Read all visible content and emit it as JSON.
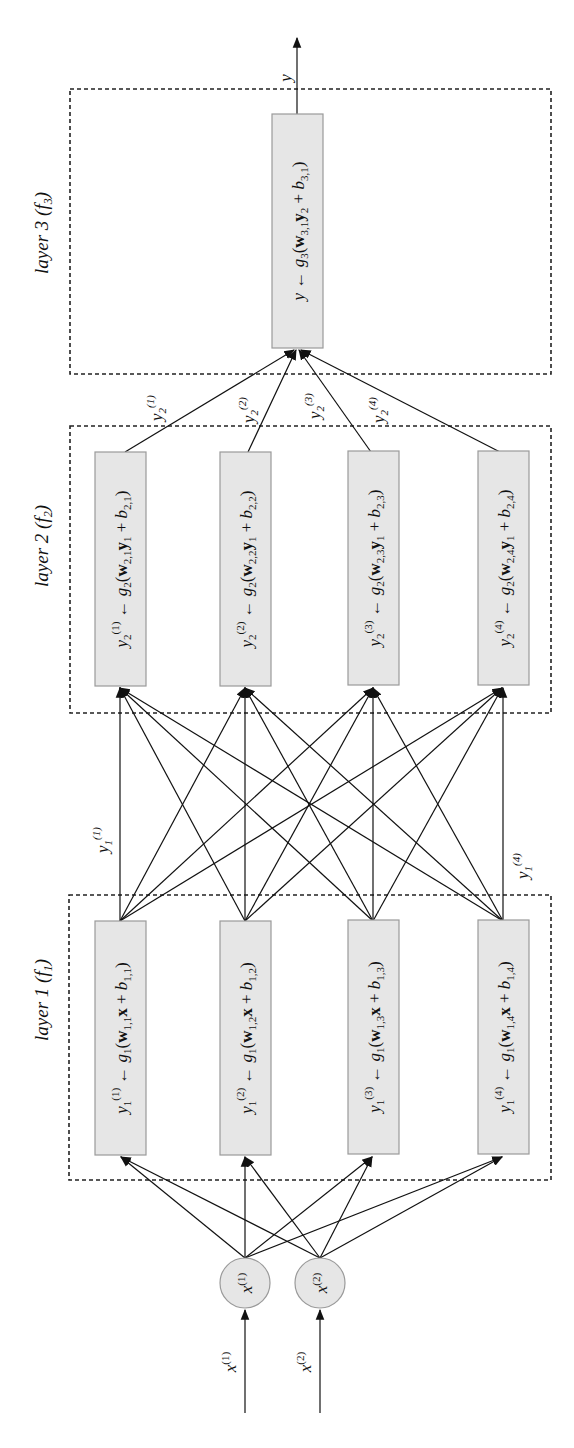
{
  "diagram": {
    "type": "feedforward-neural-network",
    "orientation": "rotated-90-ccw",
    "colors": {
      "node_fill": "#e6e6e6",
      "node_border": "#9a9a9a",
      "edge": "#111111",
      "layer_border": "#222222"
    },
    "inputs": [
      {
        "label": "x",
        "sup": "(1)",
        "node_label": "x",
        "node_sup": "(1)"
      },
      {
        "label": "x",
        "sup": "(2)",
        "node_label": "x",
        "node_sup": "(2)"
      }
    ],
    "layers": [
      {
        "label": "layer 1 (f",
        "label_sub": "1",
        "label_end": ")",
        "units": [
          {
            "lhs": "y",
            "lhs_sub": "1",
            "lhs_sup": "(1)",
            "arrow": "←",
            "g": "g",
            "g_sub": "1",
            "w": "w",
            "w_sub": "1,1",
            "input": "x",
            "plus": "+",
            "b": "b",
            "b_sub": "1,1"
          },
          {
            "lhs": "y",
            "lhs_sub": "1",
            "lhs_sup": "(2)",
            "arrow": "←",
            "g": "g",
            "g_sub": "1",
            "w": "w",
            "w_sub": "1,2",
            "input": "x",
            "plus": "+",
            "b": "b",
            "b_sub": "1,2"
          },
          {
            "lhs": "y",
            "lhs_sub": "1",
            "lhs_sup": "(3)",
            "arrow": "←",
            "g": "g",
            "g_sub": "1",
            "w": "w",
            "w_sub": "1,3",
            "input": "x",
            "plus": "+",
            "b": "b",
            "b_sub": "1,3"
          },
          {
            "lhs": "y",
            "lhs_sub": "1",
            "lhs_sup": "(4)",
            "arrow": "←",
            "g": "g",
            "g_sub": "1",
            "w": "w",
            "w_sub": "1,4",
            "input": "x",
            "plus": "+",
            "b": "b",
            "b_sub": "1,4"
          }
        ],
        "output_labels": [
          {
            "text": "y",
            "sub": "1",
            "sup": "(1)"
          },
          {
            "text": "y",
            "sub": "1",
            "sup": "(4)"
          }
        ]
      },
      {
        "label": "layer 2 (f",
        "label_sub": "2",
        "label_end": ")",
        "units": [
          {
            "lhs": "y",
            "lhs_sub": "2",
            "lhs_sup": "(1)",
            "arrow": "←",
            "g": "g",
            "g_sub": "2",
            "w": "w",
            "w_sub": "2,1",
            "input": "y",
            "input_sub": "1",
            "plus": "+",
            "b": "b",
            "b_sub": "2,1"
          },
          {
            "lhs": "y",
            "lhs_sub": "2",
            "lhs_sup": "(2)",
            "arrow": "←",
            "g": "g",
            "g_sub": "2",
            "w": "w",
            "w_sub": "2,2",
            "input": "y",
            "input_sub": "1",
            "plus": "+",
            "b": "b",
            "b_sub": "2,2"
          },
          {
            "lhs": "y",
            "lhs_sub": "2",
            "lhs_sup": "(3)",
            "arrow": "←",
            "g": "g",
            "g_sub": "2",
            "w": "w",
            "w_sub": "2,3",
            "input": "y",
            "input_sub": "1",
            "plus": "+",
            "b": "b",
            "b_sub": "2,3"
          },
          {
            "lhs": "y",
            "lhs_sub": "2",
            "lhs_sup": "(4)",
            "arrow": "←",
            "g": "g",
            "g_sub": "2",
            "w": "w",
            "w_sub": "2,4",
            "input": "y",
            "input_sub": "1",
            "plus": "+",
            "b": "b",
            "b_sub": "2,4"
          }
        ],
        "output_labels": [
          {
            "text": "y",
            "sub": "2",
            "sup": "(1)"
          },
          {
            "text": "y",
            "sub": "2",
            "sup": "(2)"
          },
          {
            "text": "y",
            "sub": "2",
            "sup": "(3)"
          },
          {
            "text": "y",
            "sub": "2",
            "sup": "(4)"
          }
        ]
      },
      {
        "label": "layer 3 (f",
        "label_sub": "3",
        "label_end": ")",
        "units": [
          {
            "lhs": "y",
            "arrow": "←",
            "g": "g",
            "g_sub": "3",
            "w": "w",
            "w_sub": "3,1",
            "input": "y",
            "input_sub": "2",
            "plus": "+",
            "b": "b",
            "b_sub": "3,1"
          }
        ],
        "output_labels": [
          {
            "text": "y"
          }
        ]
      }
    ]
  }
}
